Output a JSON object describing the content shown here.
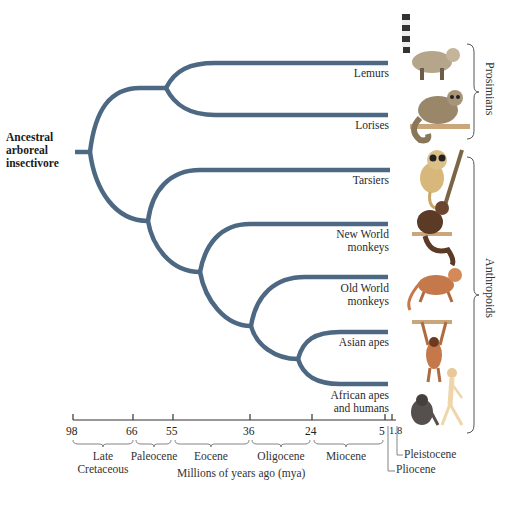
{
  "root_label": [
    "Ancestral",
    "arboreal",
    "insectivore"
  ],
  "taxa": [
    {
      "name": "Lemurs",
      "lines": [
        "Lemurs"
      ],
      "animal": "ring-tailed lemur"
    },
    {
      "name": "Lorises",
      "lines": [
        "Lorises"
      ],
      "animal": "loris"
    },
    {
      "name": "Tarsiers",
      "lines": [
        "Tarsiers"
      ],
      "animal": "tarsier"
    },
    {
      "name": "New World monkeys",
      "lines": [
        "New World",
        "monkeys"
      ],
      "animal": "capuchin-like monkey"
    },
    {
      "name": "Old World monkeys",
      "lines": [
        "Old World",
        "monkeys"
      ],
      "animal": "macaque-like monkey"
    },
    {
      "name": "Asian apes",
      "lines": [
        "Asian apes"
      ],
      "animal": "gibbon"
    },
    {
      "name": "African apes and humans",
      "lines": [
        "African apes",
        "and humans"
      ],
      "animal": "chimpanzee and human"
    }
  ],
  "groups": [
    {
      "label": "Prosimians",
      "members": [
        "Lemurs",
        "Lorises"
      ]
    },
    {
      "label": "Anthropoids",
      "members": [
        "Tarsiers",
        "New World monkeys",
        "Old World monkeys",
        "Asian apes",
        "African apes and humans"
      ]
    }
  ],
  "axis": {
    "title": "Millions of years ago (mya)",
    "ticks": [
      "98",
      "66",
      "55",
      "36",
      "24",
      "5",
      "1.8"
    ],
    "tick_text_5_18": "5|1.8"
  },
  "epochs": [
    {
      "lines": [
        "Late",
        "Cretaceous"
      ]
    },
    {
      "lines": [
        "Paleocene"
      ]
    },
    {
      "lines": [
        "Eocene"
      ]
    },
    {
      "lines": [
        "Oligocene"
      ]
    },
    {
      "lines": [
        "Miocene"
      ]
    },
    {
      "lines": [
        "Pliocene"
      ]
    },
    {
      "lines": [
        "Pleistocene"
      ]
    }
  ],
  "colors": {
    "branch": "#4d6882",
    "axis": "#333333"
  }
}
